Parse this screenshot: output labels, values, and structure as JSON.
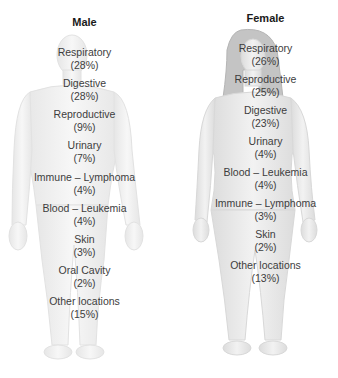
{
  "diagram": {
    "male": {
      "title": "Male",
      "sites": [
        {
          "name": "Respiratory",
          "pct": "(28%)"
        },
        {
          "name": "Digestive",
          "pct": "(28%)"
        },
        {
          "name": "Reproductive",
          "pct": "(9%)"
        },
        {
          "name": "Urinary",
          "pct": "(7%)"
        },
        {
          "name": "Immune – Lymphoma",
          "pct": "(4%)"
        },
        {
          "name": "Blood – Leukemia",
          "pct": "(4%)"
        },
        {
          "name": "Skin",
          "pct": "(3%)"
        },
        {
          "name": "Oral Cavity",
          "pct": "(2%)"
        },
        {
          "name": "Other locations",
          "pct": "(15%)"
        }
      ]
    },
    "female": {
      "title": "Female",
      "sites": [
        {
          "name": "Respiratory",
          "pct": "(26%)"
        },
        {
          "name": "Reproductive",
          "pct": "(25%)"
        },
        {
          "name": "Digestive",
          "pct": "(23%)"
        },
        {
          "name": "Urinary",
          "pct": "(4%)"
        },
        {
          "name": "Blood – Leukemia",
          "pct": "(4%)"
        },
        {
          "name": "Immune – Lymphoma",
          "pct": "(3%)"
        },
        {
          "name": "Skin",
          "pct": "(2%)"
        },
        {
          "name": "Other locations",
          "pct": "(13%)"
        }
      ]
    },
    "colors": {
      "body_fill": "#f3f3f3",
      "body_shade": "#e4e4e4",
      "hair": "#b9b9b9",
      "text": "#3d3d3d",
      "title": "#1a1a1a"
    }
  }
}
